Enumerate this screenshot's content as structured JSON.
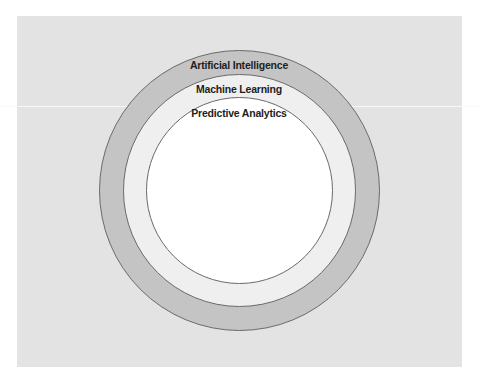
{
  "diagram": {
    "type": "nested-circles",
    "layers": [
      {
        "label": "Artificial Intelligence",
        "fill": "#c4c4c4"
      },
      {
        "label": "Machine Learning",
        "fill": "#efefef"
      },
      {
        "label": "Predictive Analytics",
        "fill": "#ffffff"
      }
    ],
    "background": "#e3e3e3",
    "stroke": "#6a6a6a"
  }
}
